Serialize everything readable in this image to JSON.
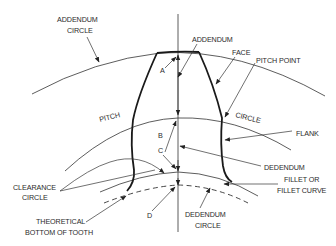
{
  "diagram": {
    "labels": {
      "addendum_circle_1": "ADDENDUM",
      "addendum_circle_2": "CIRCLE",
      "addendum": "ADDENDUM",
      "face": "FACE",
      "pitch_point": "PITCH POINT",
      "pitch": "PITCH",
      "circle": "CIRCLE",
      "flank": "FLANK",
      "dedendum": "DEDENDUM",
      "fillet_1": "FILLET OR",
      "fillet_2": "FILLET CURVE",
      "clearance_1": "CLEARANCE",
      "clearance_2": "CIRCLE",
      "theoretical_1": "THEORETICAL",
      "theoretical_2": "BOTTOM OF TOOTH",
      "dedendum_circle_1": "DEDENDUM",
      "dedendum_circle_2": "CIRCLE",
      "letter_a": "A",
      "letter_b": "B",
      "letter_c": "C",
      "letter_d": "D"
    },
    "colors": {
      "line": "#333333",
      "text": "#2b2b2b",
      "background": "#ffffff"
    }
  }
}
